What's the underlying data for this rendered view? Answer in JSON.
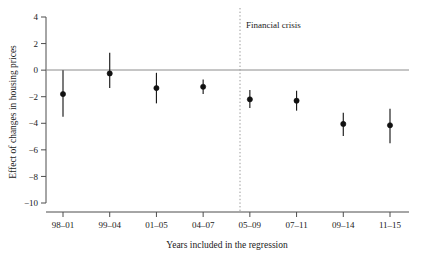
{
  "chart_data": {
    "type": "scatter",
    "title": "",
    "xlabel": "Years included in the regression",
    "ylabel": "Effect of changes in housing prices",
    "categories": [
      "98–01",
      "99–04",
      "01–05",
      "04–07",
      "05–09",
      "07–11",
      "09–14",
      "11–15"
    ],
    "values": [
      -1.8,
      -0.25,
      -1.35,
      -1.25,
      -2.2,
      -2.3,
      -4.05,
      -4.15
    ],
    "ci_low": [
      -3.5,
      -1.35,
      -2.5,
      -1.8,
      -2.85,
      -3.05,
      -4.95,
      -5.5
    ],
    "ci_high": [
      0.0,
      1.3,
      -0.2,
      -0.7,
      -1.5,
      -1.55,
      -3.2,
      -2.9
    ],
    "ylim": [
      -10,
      4
    ],
    "yticks": [
      4,
      2,
      0,
      -2,
      -4,
      -6,
      -8,
      -10
    ],
    "ytick_labels": [
      "4",
      "2",
      "0",
      "−2",
      "−4",
      "−6",
      "−8",
      "−10"
    ],
    "grid": false,
    "legend": null,
    "zero_line": 0,
    "annotations": [
      {
        "label": "Financial crisis",
        "type": "vertical-dotted-line",
        "between_categories": [
          "04–07",
          "05–09"
        ]
      }
    ]
  },
  "figure": {
    "ylabel": "Effect of changes in housing prices",
    "xlabel": "Years included in the regression",
    "crisis_label": "Financial crisis",
    "ytick_labels": [
      "4",
      "2",
      "0",
      "−2",
      "−4",
      "−6",
      "−8",
      "−10"
    ],
    "xtick_labels": [
      "98–01",
      "99–04",
      "01–05",
      "04–07",
      "05–09",
      "07–11",
      "09–14",
      "11–15"
    ],
    "colors": {
      "marker": "#111111",
      "axis": "#4d4d4d",
      "zero_line": "#8c8c8c",
      "crisis_line": "#9a9a9a",
      "background": "#ffffff"
    }
  }
}
